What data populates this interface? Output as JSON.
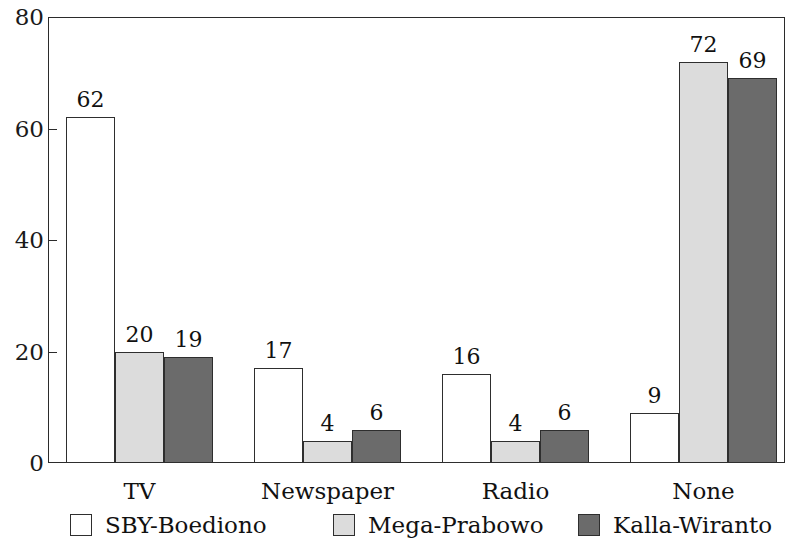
{
  "chart_data": {
    "type": "bar",
    "title": "",
    "subtitle": "",
    "xlabel": "",
    "ylabel": "",
    "categories": [
      "TV",
      "Newspaper",
      "Radio",
      "None"
    ],
    "series": [
      {
        "name": "SBY-Boediono",
        "values": [
          62,
          17,
          16,
          9
        ],
        "color": "#ffffff"
      },
      {
        "name": "Mega-Prabowo",
        "values": [
          20,
          4,
          4,
          72
        ],
        "color": "#dcdcdc"
      },
      {
        "name": "Kalla-Wiranto",
        "values": [
          19,
          6,
          6,
          69
        ],
        "color": "#6b6b6b"
      }
    ],
    "ylim": [
      0,
      80
    ],
    "yticks": [
      0,
      20,
      40,
      60,
      80
    ],
    "ytick_labels": [
      "0",
      "20",
      "40",
      "60",
      "80"
    ],
    "grid": false,
    "data_labels": true,
    "legend_position": "bottom",
    "legend_entries": [
      "SBY-Boediono",
      "Mega-Prabowo",
      "Kalla-Wiranto"
    ],
    "bar_outline_color": "#2e2e2e",
    "frame_color": "#2b2b2b"
  }
}
